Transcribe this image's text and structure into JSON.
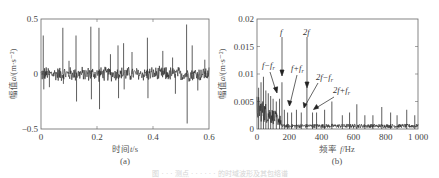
{
  "chart_data": [
    {
      "id": "a",
      "type": "line",
      "title": "",
      "subplot_label": "(a)",
      "xlabel": "时间 t/s",
      "ylabel": "幅值 a/(m·s⁻²)",
      "xlim": [
        0,
        0.6
      ],
      "ylim": [
        -0.5,
        0.5
      ],
      "xticks": [
        "0",
        "0.2",
        "0.4",
        "0.6"
      ],
      "yticks": [
        "0.5",
        "0",
        "−0.5"
      ],
      "grid": false,
      "description": "Time-domain vibration signal: noise band about ±0.07 with periodic impulse spikes",
      "spikes": [
        {
          "t": 0.008,
          "a": 0.35
        },
        {
          "t": 0.01,
          "a": -0.14
        },
        {
          "t": 0.03,
          "a": -0.12
        },
        {
          "t": 0.078,
          "a": 0.42
        },
        {
          "t": 0.08,
          "a": -0.09
        },
        {
          "t": 0.1,
          "a": 0.12
        },
        {
          "t": 0.125,
          "a": 0.35
        },
        {
          "t": 0.127,
          "a": -0.25
        },
        {
          "t": 0.178,
          "a": 0.43
        },
        {
          "t": 0.18,
          "a": -0.23
        },
        {
          "t": 0.207,
          "a": 0.42
        },
        {
          "t": 0.209,
          "a": -0.32
        },
        {
          "t": 0.248,
          "a": 0.18
        },
        {
          "t": 0.275,
          "a": 0.26
        },
        {
          "t": 0.277,
          "a": -0.22
        },
        {
          "t": 0.295,
          "a": 0.28
        },
        {
          "t": 0.297,
          "a": -0.14
        },
        {
          "t": 0.325,
          "a": 0.2
        },
        {
          "t": 0.38,
          "a": 0.33
        },
        {
          "t": 0.382,
          "a": -0.22
        },
        {
          "t": 0.435,
          "a": 0.21
        },
        {
          "t": 0.47,
          "a": 0.15
        },
        {
          "t": 0.48,
          "a": -0.18
        },
        {
          "t": 0.52,
          "a": 0.45
        },
        {
          "t": 0.522,
          "a": -0.45
        },
        {
          "t": 0.54,
          "a": 0.26
        },
        {
          "t": 0.56,
          "a": -0.15
        },
        {
          "t": 0.585,
          "a": 0.13
        }
      ],
      "noise_amplitude": 0.07
    },
    {
      "id": "b",
      "type": "line",
      "title": "",
      "subplot_label": "(b)",
      "xlabel": "频率 f/Hz",
      "ylabel": "幅值 a/(m·s⁻²)",
      "xlim": [
        0,
        1000
      ],
      "ylim": [
        0,
        0.02
      ],
      "xticks": [
        "0",
        "200",
        "400",
        "600",
        "800",
        "1 000"
      ],
      "yticks": [
        "0.02",
        "0.015",
        "0.01",
        "0.005",
        "0"
      ],
      "grid": false,
      "description": "Amplitude spectrum: dense low-frequency content, characteristic peak f and harmonics with sidebands",
      "peaks": [
        {
          "f": 10,
          "a": 0.0075
        },
        {
          "f": 25,
          "a": 0.0085
        },
        {
          "f": 40,
          "a": 0.0095
        },
        {
          "f": 55,
          "a": 0.007
        },
        {
          "f": 70,
          "a": 0.0065
        },
        {
          "f": 85,
          "a": 0.006
        },
        {
          "f": 100,
          "a": 0.0055
        },
        {
          "f": 120,
          "a": 0.005
        },
        {
          "f": 140,
          "a": 0.0055
        },
        {
          "f": 155,
          "a": 0.0085
        },
        {
          "f": 170,
          "a": 0.0035
        },
        {
          "f": 190,
          "a": 0.003
        },
        {
          "f": 215,
          "a": 0.003
        },
        {
          "f": 245,
          "a": 0.0035
        },
        {
          "f": 275,
          "a": 0.003
        },
        {
          "f": 310,
          "a": 0.0075
        },
        {
          "f": 345,
          "a": 0.003
        },
        {
          "f": 370,
          "a": 0.003
        },
        {
          "f": 420,
          "a": 0.0035
        },
        {
          "f": 465,
          "a": 0.005
        },
        {
          "f": 530,
          "a": 0.0025
        },
        {
          "f": 575,
          "a": 0.003
        },
        {
          "f": 620,
          "a": 0.0045
        },
        {
          "f": 670,
          "a": 0.0025
        },
        {
          "f": 720,
          "a": 0.0025
        },
        {
          "f": 775,
          "a": 0.004
        },
        {
          "f": 830,
          "a": 0.003
        },
        {
          "f": 870,
          "a": 0.0025
        },
        {
          "f": 930,
          "a": 0.0035
        },
        {
          "f": 980,
          "a": 0.0025
        }
      ],
      "annotations": [
        {
          "text": "f",
          "points_to_f": 155,
          "points_to_a": 0.0085
        },
        {
          "text": "2f",
          "points_to_f": 310,
          "points_to_a": 0.0075
        },
        {
          "text": "f−fr",
          "points_to_f": 120,
          "points_to_a": 0.005
        },
        {
          "text": "f+fr",
          "points_to_f": 190,
          "points_to_a": 0.003
        },
        {
          "text": "2f−fr",
          "points_to_f": 275,
          "points_to_a": 0.003
        },
        {
          "text": "2f+fr",
          "points_to_f": 345,
          "points_to_a": 0.003
        }
      ]
    }
  ],
  "labels": {
    "a": {
      "ytick_top": "0.5",
      "ytick_mid": "0",
      "ytick_bot": "−0.5",
      "xt0": "0",
      "xt1": "0.2",
      "xt2": "0.4",
      "xt3": "0.6",
      "xlabel_cn": "时间",
      "xlabel_var": "t",
      "xlabel_unit": "/s",
      "ylabel_cn": "幅值",
      "ylabel_var": "a",
      "ylabel_unit": "/(m·s⁻²)",
      "sub": "(a)"
    },
    "b": {
      "yt0": "0.02",
      "yt1": "0.015",
      "yt2": "0.01",
      "yt3": "0.005",
      "yt4": "0",
      "xt0": "0",
      "xt1": "200",
      "xt2": "400",
      "xt3": "600",
      "xt4": "800",
      "xt5": "1 000",
      "xlabel_cn": "频率 ",
      "xlabel_var": "f",
      "xlabel_unit": "/Hz",
      "ylabel_cn": "幅值",
      "ylabel_var": "a",
      "ylabel_unit": "/(m·s⁻²)",
      "sub": "(b)",
      "ann_f": "f",
      "ann_2f": "2f",
      "ann_f_minus": "f−f",
      "ann_f_plus": "f+f",
      "ann_2f_minus": "2f−f",
      "ann_2f_plus": "2f+f",
      "ann_sub_r": "r"
    }
  },
  "caption": "图 · · · 测点 · · · · · · 的时域波形及其包络谱"
}
